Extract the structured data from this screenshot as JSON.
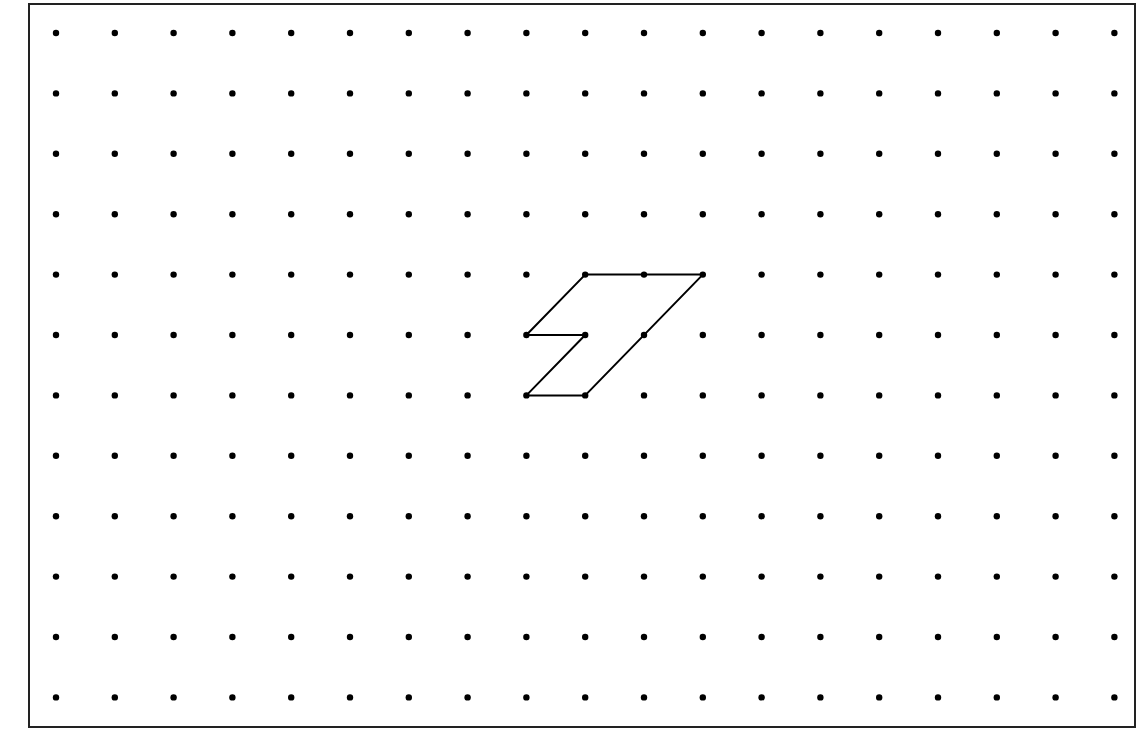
{
  "diagram": {
    "type": "dot-grid-with-polygon",
    "background": "#ffffff",
    "frame": {
      "x": 29,
      "y": 4,
      "width": 1106,
      "height": 723,
      "stroke": "#222222",
      "stroke_width": 2
    },
    "grid": {
      "columns": 19,
      "rows": 12,
      "origin_x": 56,
      "origin_y": 33,
      "spacing_x": 58.8,
      "spacing_y": 60.4,
      "dot_radius": 3.2,
      "dot_color": "#000000"
    },
    "polygon": {
      "description": "Lightning-bolt / Z-like hexagon drawn on the dot grid",
      "vertices_grid": [
        [
          9,
          4
        ],
        [
          11,
          4
        ],
        [
          9,
          6
        ],
        [
          8,
          6
        ],
        [
          9,
          5
        ],
        [
          8,
          5
        ]
      ],
      "extra_dots_on_edges_grid": [
        [
          10,
          4
        ],
        [
          10,
          5
        ]
      ],
      "stroke": "#000000",
      "stroke_width": 2
    }
  }
}
